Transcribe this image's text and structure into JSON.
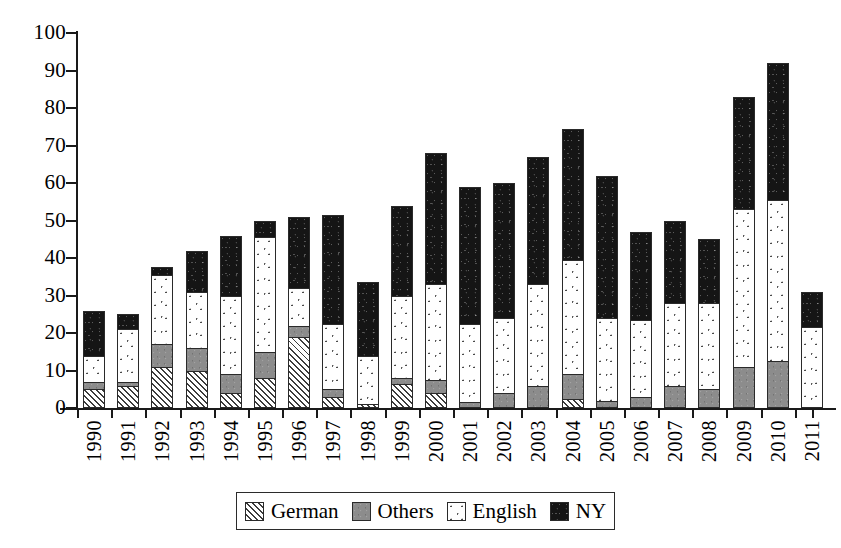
{
  "chart_data": {
    "type": "bar",
    "subtype": "stacked-bar",
    "title": "",
    "xlabel": "",
    "ylabel": "",
    "ylim": [
      0,
      100
    ],
    "yticks": [
      0,
      10,
      20,
      30,
      40,
      50,
      60,
      70,
      80,
      90,
      100
    ],
    "grid": false,
    "legend_position": "bottom-center",
    "stack_order_bottom_to_top": [
      "German",
      "Others",
      "English",
      "NY"
    ],
    "categories": [
      "1990",
      "1991",
      "1992",
      "1993",
      "1994",
      "1995",
      "1996",
      "1997",
      "1998",
      "1999",
      "2000",
      "2001",
      "2002",
      "2003",
      "2004",
      "2005",
      "2006",
      "2007",
      "2008",
      "2009",
      "2010",
      "2011"
    ],
    "series": [
      {
        "name": "German",
        "pattern": "diagonal-hatch",
        "color": "#ffffff",
        "values": [
          5,
          6,
          11,
          10,
          4,
          8,
          19,
          3,
          1,
          6.5,
          4,
          0,
          0,
          0,
          2.5,
          0,
          0,
          0,
          0,
          0,
          0,
          0
        ]
      },
      {
        "name": "Others",
        "pattern": "solid-gray",
        "color": "#8c8c8c",
        "values": [
          2,
          1,
          6,
          6,
          5,
          7,
          3,
          2,
          0,
          1.5,
          3.5,
          1.5,
          4,
          6,
          6.5,
          2,
          3,
          6,
          5,
          11,
          12.5,
          0
        ]
      },
      {
        "name": "English",
        "pattern": "dotted",
        "color": "#ffffff",
        "values": [
          7,
          14,
          18.5,
          15,
          21,
          30.5,
          10,
          17.5,
          13,
          22,
          25.5,
          21,
          20,
          27,
          30.5,
          22,
          20.5,
          22,
          23,
          42,
          43,
          21.5
        ]
      },
      {
        "name": "NY",
        "pattern": "solid-black",
        "color": "#151515",
        "values": [
          12,
          4,
          2,
          11,
          16,
          4.5,
          19,
          29,
          19.5,
          24,
          35,
          36.5,
          36,
          34,
          35,
          38,
          23.5,
          22,
          17,
          30,
          36.5,
          9.5
        ]
      }
    ],
    "totals": [
      26,
      25,
      37.5,
      42,
      46,
      50,
      51,
      51.5,
      33.5,
      54,
      68,
      59,
      60,
      67,
      74.5,
      62,
      47,
      50,
      45,
      83,
      92,
      31
    ]
  },
  "legend": {
    "items": [
      {
        "label": "German",
        "swatch": "diagonal-hatch-swatch"
      },
      {
        "label": "Others",
        "swatch": "solid-gray-swatch"
      },
      {
        "label": "English",
        "swatch": "dotted-swatch"
      },
      {
        "label": "NY",
        "swatch": "solid-black-swatch"
      }
    ]
  }
}
